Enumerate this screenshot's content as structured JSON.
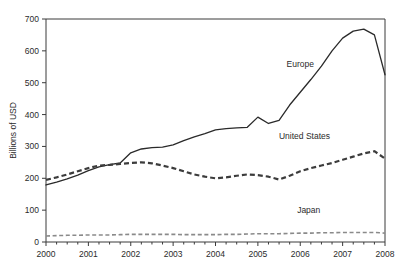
{
  "chart_data": {
    "type": "line",
    "title": "",
    "xlabel": "",
    "ylabel": "Billions of USD",
    "xlim": [
      2000,
      2008
    ],
    "ylim": [
      0,
      700
    ],
    "yticks": [
      0,
      100,
      200,
      300,
      400,
      500,
      600,
      700
    ],
    "xticks": [
      2000,
      2001,
      2002,
      2003,
      2004,
      2005,
      2006,
      2007,
      2008
    ],
    "xtick_labels": [
      "2000",
      "2001",
      "2002",
      "2003",
      "2004",
      "2005",
      "2006",
      "2007",
      "2008"
    ],
    "ytick_labels": [
      "0",
      "100",
      "200",
      "300",
      "400",
      "500",
      "600",
      "700"
    ],
    "minor_xticks_per_year": 4,
    "grid": false,
    "legend_position": "inline-annotations",
    "x": [
      2000.0,
      2000.25,
      2000.5,
      2000.75,
      2001.0,
      2001.25,
      2001.5,
      2001.75,
      2002.0,
      2002.25,
      2002.5,
      2002.75,
      2003.0,
      2003.25,
      2003.5,
      2003.75,
      2004.0,
      2004.25,
      2004.5,
      2004.75,
      2005.0,
      2005.25,
      2005.5,
      2005.75,
      2006.0,
      2006.25,
      2006.5,
      2006.75,
      2007.0,
      2007.25,
      2007.5,
      2007.75,
      2008.0
    ],
    "series": [
      {
        "name": "Europe",
        "style": "solid",
        "color": "#2a2a2a",
        "label_x": 2006.0,
        "label_y": 550,
        "values": [
          179,
          188,
          198,
          210,
          224,
          236,
          243,
          248,
          280,
          292,
          296,
          298,
          305,
          318,
          330,
          340,
          352,
          356,
          358,
          360,
          392,
          372,
          382,
          430,
          470,
          510,
          552,
          600,
          640,
          662,
          668,
          650,
          525
        ]
      },
      {
        "name": "United States",
        "style": "dashed",
        "color": "#3c3c3c",
        "label_x": 2006.1,
        "label_y": 322,
        "values": [
          195,
          203,
          212,
          222,
          232,
          240,
          242,
          245,
          248,
          250,
          247,
          240,
          232,
          222,
          212,
          205,
          200,
          203,
          208,
          212,
          210,
          205,
          196,
          208,
          222,
          232,
          240,
          248,
          258,
          268,
          278,
          285,
          262
        ]
      },
      {
        "name": "Japan",
        "style": "dashed-light",
        "color": "#8a8a8a",
        "label_x": 2006.2,
        "label_y": 92,
        "values": [
          19,
          20,
          21,
          21,
          22,
          22,
          22,
          23,
          24,
          24,
          24,
          24,
          24,
          23,
          23,
          23,
          23,
          24,
          24,
          25,
          26,
          26,
          26,
          27,
          28,
          28,
          29,
          29,
          30,
          30,
          30,
          30,
          28
        ]
      }
    ]
  }
}
